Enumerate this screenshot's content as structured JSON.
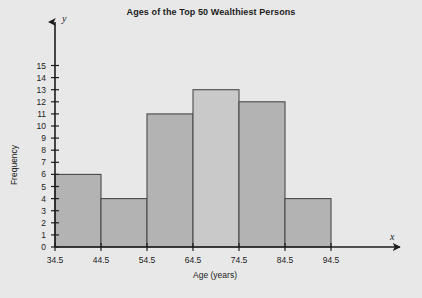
{
  "chart_data": {
    "type": "bar",
    "title": "Ages of the Top 50 Wealthiest Persons",
    "xlabel": "Age (years)",
    "ylabel": "Frequency",
    "x_axis_letter": "y",
    "y_axis_letter": "x",
    "categories": [
      "34.5-44.5",
      "44.5-54.5",
      "54.5-64.5",
      "64.5-74.5",
      "74.5-84.5",
      "84.5-94.5"
    ],
    "values": [
      6,
      4,
      11,
      13,
      12,
      4
    ],
    "bin_edges": [
      "34.5",
      "44.5",
      "54.5",
      "64.5",
      "74.5",
      "84.5",
      "94.5"
    ],
    "xticklabels": [
      "34.5",
      "44.5",
      "54.5",
      "64.5",
      "74.5",
      "84.5",
      "94.5"
    ],
    "yticklabels": [
      "0",
      "1",
      "2",
      "3",
      "4",
      "5",
      "6",
      "7",
      "8",
      "9",
      "10",
      "11",
      "12",
      "13",
      "14",
      "15"
    ],
    "ylim": [
      0,
      15
    ],
    "ytick_step": 1,
    "grid": false,
    "legend": false,
    "bar_fill": "#b3b3b3",
    "bar_fill_highlight": "#c9c9c9",
    "bar_stroke": "#4a4a4a",
    "axis_color": "#1c1c1c",
    "background": "#e8e8e8",
    "highlight_index": 3
  }
}
